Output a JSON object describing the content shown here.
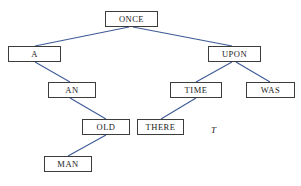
{
  "figure": {
    "type": "tree-diagram",
    "label": "T",
    "edge_color": "#3d5a96",
    "node_border_color": "#3c3c3c",
    "node_text_color": "#1a1a1a",
    "background_color": "#ffffff",
    "width": 301,
    "height": 186
  },
  "nodes": [
    {
      "id": "once",
      "label": "ONCE",
      "x": 105,
      "y": 11,
      "w": 53,
      "h": 16,
      "level": 0
    },
    {
      "id": "a",
      "label": "A",
      "x": 8,
      "y": 46,
      "w": 53,
      "h": 16,
      "level": 1
    },
    {
      "id": "upon",
      "label": "UPON",
      "x": 208,
      "y": 46,
      "w": 53,
      "h": 16,
      "level": 1
    },
    {
      "id": "an",
      "label": "AN",
      "x": 48,
      "y": 82,
      "w": 48,
      "h": 16,
      "level": 2
    },
    {
      "id": "time",
      "label": "TIME",
      "x": 170,
      "y": 82,
      "w": 52,
      "h": 16,
      "level": 2
    },
    {
      "id": "was",
      "label": "WAS",
      "x": 246,
      "y": 82,
      "w": 49,
      "h": 16,
      "level": 2
    },
    {
      "id": "old",
      "label": "OLD",
      "x": 82,
      "y": 119,
      "w": 48,
      "h": 16,
      "level": 3
    },
    {
      "id": "there",
      "label": "THERE",
      "x": 137,
      "y": 119,
      "w": 47,
      "h": 16,
      "level": 3
    },
    {
      "id": "man",
      "label": "MAN",
      "x": 44,
      "y": 156,
      "w": 48,
      "h": 16,
      "level": 4
    }
  ],
  "edges": [
    {
      "from": "once",
      "to": "a",
      "x1": 129,
      "y1": 27,
      "x2": 35,
      "y2": 46
    },
    {
      "from": "once",
      "to": "upon",
      "x1": 133,
      "y1": 27,
      "x2": 232,
      "y2": 46
    },
    {
      "from": "a",
      "to": "an",
      "x1": 35,
      "y1": 62,
      "x2": 70,
      "y2": 82
    },
    {
      "from": "upon",
      "to": "time",
      "x1": 232,
      "y1": 62,
      "x2": 196,
      "y2": 82
    },
    {
      "from": "upon",
      "to": "was",
      "x1": 236,
      "y1": 62,
      "x2": 270,
      "y2": 82
    },
    {
      "from": "an",
      "to": "old",
      "x1": 70,
      "y1": 98,
      "x2": 106,
      "y2": 119
    },
    {
      "from": "time",
      "to": "there",
      "x1": 196,
      "y1": 98,
      "x2": 161,
      "y2": 119
    },
    {
      "from": "old",
      "to": "man",
      "x1": 106,
      "y1": 135,
      "x2": 68,
      "y2": 156
    }
  ],
  "annotation": {
    "text": "T",
    "x": 211,
    "y": 126
  }
}
